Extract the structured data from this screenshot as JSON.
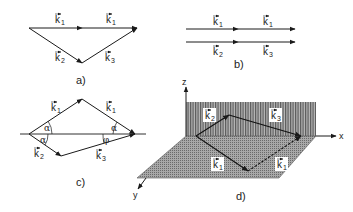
{
  "figure": {
    "panels": [
      {
        "id": "a",
        "caption": "a)",
        "description": "Vector triangle: k1 + k1 = k2 + k3 (collinear k1 vectors on top, k2 and k3 below)",
        "labels": {
          "top_left": "k",
          "top_left_sub": "1",
          "top_right": "k",
          "top_right_sub": "1",
          "bottom_left": "k",
          "bottom_left_sub": "2",
          "bottom_right": "k",
          "bottom_right_sub": "3"
        }
      },
      {
        "id": "b",
        "caption": "b)",
        "description": "Collinear case: k1 + k1 on top line, k2 + k3 on bottom line",
        "labels": {
          "top_left": "k",
          "top_left_sub": "1",
          "top_right": "k",
          "top_right_sub": "1",
          "bottom_left": "k",
          "bottom_left_sub": "2",
          "bottom_right": "k",
          "bottom_right_sub": "3"
        }
      },
      {
        "id": "c",
        "caption": "c)",
        "description": "Non-collinear phase matching with angles alpha and phi",
        "labels": {
          "top_left": "k",
          "top_left_sub": "1",
          "top_right": "k",
          "top_right_sub": "1",
          "bottom_left": "k",
          "bottom_left_sub": "2",
          "bottom_right": "k",
          "bottom_right_sub": "3"
        },
        "angles": {
          "alpha": "α",
          "phi": "φ"
        }
      },
      {
        "id": "d",
        "caption": "d)",
        "description": "3D geometry: k1 vectors in the xy-plane (floor), k2 and k3 in the xz-plane (wall)",
        "axes": {
          "x": "x",
          "y": "y",
          "z": "z"
        },
        "labels": {
          "floor_left": "k",
          "floor_left_sub": "1",
          "floor_right": "k",
          "floor_right_sub": "1",
          "wall_left": "k",
          "wall_left_sub": "2",
          "wall_right": "k",
          "wall_right_sub": "3"
        }
      }
    ]
  },
  "colors": {
    "line": "#1a1a1a",
    "wall": "#8a8a8a",
    "floor": "#9c9c9c",
    "label_bg": "#ffffff"
  }
}
